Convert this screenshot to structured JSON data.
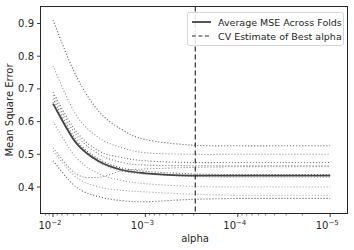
{
  "chart_data": {
    "type": "line",
    "title": "",
    "xlabel": "alpha",
    "ylabel": "Mean Square Error",
    "xscale": "log",
    "x_inverted": true,
    "xlim": [
      0.0125,
      8.5e-06
    ],
    "ylim": [
      0.32,
      0.945
    ],
    "x_ticks": [
      {
        "exp": -2,
        "label": "10",
        "sup": "−2"
      },
      {
        "exp": -3,
        "label": "10",
        "sup": "−3"
      },
      {
        "exp": -4,
        "label": "10",
        "sup": "−4"
      },
      {
        "exp": -5,
        "label": "10",
        "sup": "−5"
      }
    ],
    "y_ticks": [
      {
        "value": 0.4,
        "label": "0.4"
      },
      {
        "value": 0.5,
        "label": "0.5"
      },
      {
        "value": 0.6,
        "label": "0.6"
      },
      {
        "value": 0.7,
        "label": "0.7"
      },
      {
        "value": 0.8,
        "label": "0.8"
      },
      {
        "value": 0.9,
        "label": "0.9"
      }
    ],
    "grid": false,
    "legend": {
      "position": "upper right",
      "entries": [
        {
          "label": "Average MSE Across Folds",
          "style": "solid"
        },
        {
          "label": "CV Estimate of Best alpha",
          "style": "dashed"
        }
      ]
    },
    "x_log10": [
      -2.0,
      -2.25,
      -2.5,
      -2.75,
      -3.0,
      -3.5,
      -4.0,
      -4.5,
      -5.0
    ],
    "series": [
      {
        "name": "Average MSE Across Folds",
        "style": "solid",
        "color": "#444444",
        "values": [
          0.655,
          0.535,
          0.478,
          0.452,
          0.442,
          0.435,
          0.435,
          0.435,
          0.435
        ]
      },
      {
        "name": "Fold 1",
        "style": "dotted",
        "color": "#555555",
        "values": [
          0.91,
          0.74,
          0.63,
          0.575,
          0.545,
          0.528,
          0.526,
          0.526,
          0.526
        ]
      },
      {
        "name": "Fold 2",
        "style": "dotted",
        "color": "#888888",
        "values": [
          0.77,
          0.62,
          0.55,
          0.52,
          0.505,
          0.5,
          0.5,
          0.5,
          0.5
        ]
      },
      {
        "name": "Fold 3",
        "style": "dotted",
        "color": "#666666",
        "values": [
          0.69,
          0.57,
          0.51,
          0.49,
          0.48,
          0.475,
          0.475,
          0.475,
          0.475
        ]
      },
      {
        "name": "Fold 4",
        "style": "dotted",
        "color": "#777777",
        "values": [
          0.68,
          0.56,
          0.5,
          0.475,
          0.467,
          0.465,
          0.465,
          0.465,
          0.465
        ]
      },
      {
        "name": "Fold 5",
        "style": "dotted",
        "color": "#555555",
        "values": [
          0.67,
          0.545,
          0.485,
          0.458,
          0.448,
          0.44,
          0.438,
          0.438,
          0.438
        ]
      },
      {
        "name": "Fold 6",
        "style": "dotted",
        "color": "#999999",
        "values": [
          0.66,
          0.535,
          0.475,
          0.448,
          0.44,
          0.432,
          0.43,
          0.43,
          0.43
        ]
      },
      {
        "name": "Fold 7",
        "style": "dotted",
        "color": "#999999",
        "values": [
          0.6,
          0.49,
          0.44,
          0.42,
          0.41,
          0.402,
          0.4,
          0.4,
          0.4
        ]
      },
      {
        "name": "Fold 8",
        "style": "dotted",
        "color": "#777777",
        "values": [
          0.52,
          0.44,
          0.43,
          0.45,
          0.455,
          0.46,
          0.462,
          0.462,
          0.462
        ]
      },
      {
        "name": "Fold 9",
        "style": "dotted",
        "color": "#999999",
        "values": [
          0.51,
          0.43,
          0.4,
          0.39,
          0.385,
          0.378,
          0.375,
          0.375,
          0.375
        ]
      },
      {
        "name": "Fold 10",
        "style": "dotted",
        "color": "#555555",
        "values": [
          0.48,
          0.4,
          0.37,
          0.358,
          0.355,
          0.362,
          0.365,
          0.365,
          0.365
        ]
      }
    ],
    "best_alpha_log10": -3.54,
    "best_alpha_line": {
      "style": "dashed",
      "color": "#333333"
    }
  }
}
